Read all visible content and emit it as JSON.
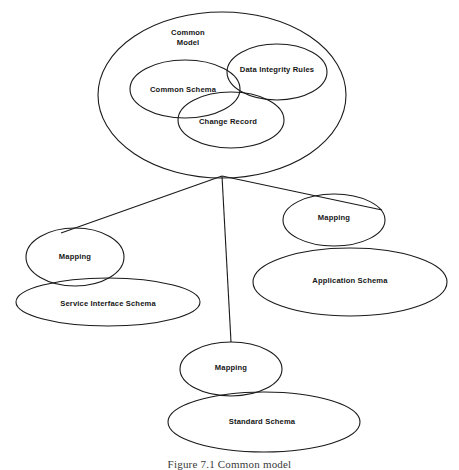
{
  "figure": {
    "caption": "Figure 7.1 Common model",
    "type": "venn-hierarchy-diagram",
    "background_color": "#ffffff",
    "stroke_color": "#1a1a1a",
    "text_color": "#161616"
  },
  "nodes": [
    {
      "id": "common-model",
      "label": "Common\nModel",
      "cx": 222,
      "cy": 95,
      "rx": 124,
      "ry": 83,
      "label_x": 188,
      "label_y": 38,
      "level": "container"
    },
    {
      "id": "common-schema",
      "label": "Common Schema",
      "cx": 185,
      "cy": 89,
      "rx": 55,
      "ry": 29,
      "label_x": 183,
      "label_y": 90,
      "level": "inner"
    },
    {
      "id": "data-integrity-rules",
      "label": "Data Integrity Rules",
      "cx": 277,
      "cy": 72,
      "rx": 50,
      "ry": 28,
      "label_x": 277,
      "label_y": 70,
      "level": "inner"
    },
    {
      "id": "change-record",
      "label": "Change Record",
      "cx": 231,
      "cy": 120,
      "rx": 53,
      "ry": 28,
      "label_x": 228,
      "label_y": 122,
      "level": "inner"
    },
    {
      "id": "mapping-left",
      "label": "Mapping",
      "cx": 75,
      "cy": 257,
      "rx": 49,
      "ry": 29,
      "label_x": 75,
      "label_y": 257,
      "level": "branch"
    },
    {
      "id": "service-interface-schema",
      "label": "Service Interface Schema",
      "cx": 108,
      "cy": 302,
      "rx": 92,
      "ry": 24,
      "label_x": 108,
      "label_y": 304,
      "level": "leaf"
    },
    {
      "id": "mapping-right",
      "label": "Mapping",
      "cx": 334,
      "cy": 220,
      "rx": 51,
      "ry": 26,
      "label_x": 334,
      "label_y": 218,
      "level": "branch"
    },
    {
      "id": "application-schema",
      "label": "Application Schema",
      "cx": 350,
      "cy": 282,
      "rx": 97,
      "ry": 34,
      "label_x": 350,
      "label_y": 281,
      "level": "leaf"
    },
    {
      "id": "mapping-bottom",
      "label": "Mapping",
      "cx": 231,
      "cy": 369,
      "rx": 51,
      "ry": 27,
      "label_x": 231,
      "label_y": 368,
      "level": "branch"
    },
    {
      "id": "standard-schema",
      "label": "Standard Schema",
      "cx": 264,
      "cy": 422,
      "rx": 96,
      "ry": 30,
      "label_x": 262,
      "label_y": 422,
      "level": "leaf"
    }
  ],
  "connectors": [
    {
      "id": "to-mapping-left",
      "x1": 222,
      "y1": 176,
      "x2": 61,
      "y2": 233
    },
    {
      "id": "to-mapping-bottom",
      "x1": 222,
      "y1": 176,
      "x2": 231,
      "y2": 342
    },
    {
      "id": "to-mapping-right",
      "x1": 222,
      "y1": 176,
      "x2": 382,
      "y2": 210
    }
  ]
}
